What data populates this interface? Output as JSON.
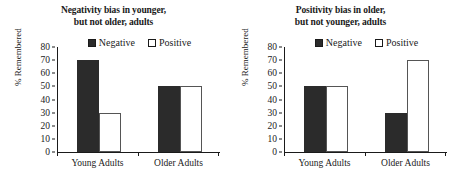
{
  "chart_data": [
    {
      "type": "bar",
      "title": "Negativity bias in younger, but not older, adults",
      "title_lines": [
        "Negativity bias in younger,",
        "but not older, adults"
      ],
      "categories": [
        "Young Adults",
        "Older Adults"
      ],
      "series": [
        {
          "name": "Negative",
          "values": [
            70,
            50
          ],
          "color": "#2b2b2b"
        },
        {
          "name": "Positive",
          "values": [
            30,
            50
          ],
          "color": "#ffffff"
        }
      ],
      "xlabel": "",
      "ylabel": "% Remembered",
      "ylim": [
        0,
        80
      ],
      "yticks": [
        0,
        10,
        20,
        30,
        40,
        50,
        60,
        70,
        80
      ],
      "grid": false,
      "legend_position": "top-center"
    },
    {
      "type": "bar",
      "title": "Positivity bias in older, but not younger, adults",
      "title_lines": [
        "Positivity bias in older,",
        "but not younger, adults"
      ],
      "categories": [
        "Young Adults",
        "Older Adults"
      ],
      "series": [
        {
          "name": "Negative",
          "values": [
            50,
            30
          ],
          "color": "#2b2b2b"
        },
        {
          "name": "Positive",
          "values": [
            50,
            70
          ],
          "color": "#ffffff"
        }
      ],
      "xlabel": "",
      "ylabel": "% Remembered",
      "ylim": [
        0,
        80
      ],
      "yticks": [
        0,
        10,
        20,
        30,
        40,
        50,
        60,
        70,
        80
      ],
      "grid": false,
      "legend_position": "top-center"
    }
  ]
}
